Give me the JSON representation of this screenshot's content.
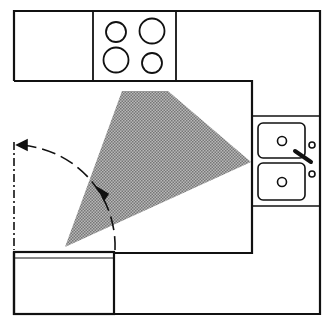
{
  "diagram": {
    "colors": {
      "line": "#111111",
      "triangle_fill": "#9a9a9a",
      "background": "#ffffff"
    },
    "elements": [
      {
        "name": "countertop-top",
        "type": "cabinet"
      },
      {
        "name": "cooktop",
        "type": "appliance",
        "burners": 4
      },
      {
        "name": "countertop-right",
        "type": "cabinet"
      },
      {
        "name": "double-sink",
        "type": "fixture",
        "basins": 2
      },
      {
        "name": "refrigerator",
        "type": "appliance"
      },
      {
        "name": "door-swing",
        "type": "door"
      },
      {
        "name": "work-triangle",
        "type": "shaded-area"
      }
    ]
  }
}
